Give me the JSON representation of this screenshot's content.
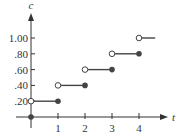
{
  "chart_data": {
    "type": "line",
    "subtype": "step-function",
    "title": "",
    "xlabel": "t",
    "ylabel": "c",
    "x_ticks": [
      "1",
      "2",
      "3",
      "4"
    ],
    "y_ticks": [
      ".20",
      ".40",
      ".60",
      ".80",
      "1.00"
    ],
    "xlim": [
      0,
      5
    ],
    "ylim": [
      0,
      1.1
    ],
    "grid": false,
    "legend": null,
    "segments": [
      {
        "x_start": 0,
        "x_end": 1,
        "y": 0.2,
        "start": "open",
        "end": "closed"
      },
      {
        "x_start": 1,
        "x_end": 2,
        "y": 0.4,
        "start": "open",
        "end": "closed"
      },
      {
        "x_start": 2,
        "x_end": 3,
        "y": 0.6,
        "start": "open",
        "end": "closed"
      },
      {
        "x_start": 3,
        "x_end": 4,
        "y": 0.8,
        "start": "open",
        "end": "closed"
      },
      {
        "x_start": 4,
        "x_end": 4.6,
        "y": 1.0,
        "start": "open",
        "end": "continues"
      }
    ],
    "points": [
      {
        "x": 0,
        "y": 0,
        "style": "closed"
      }
    ]
  },
  "colors": {
    "axis": "#333333",
    "line": "#444444",
    "open_fill": "#ffffff"
  }
}
